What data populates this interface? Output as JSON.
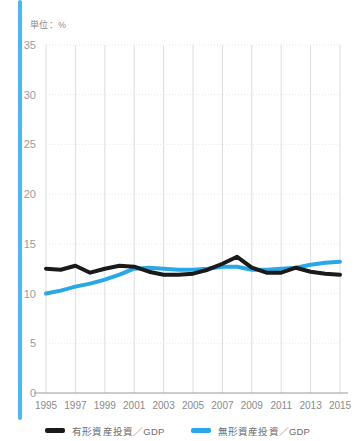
{
  "accent_color": "#4db8f0",
  "unit_label": "単位：%",
  "legend": {
    "items": [
      {
        "label": "有形資産投資／GDP",
        "color": "#1a1a1a"
      },
      {
        "label": "無形資産投資／GDP",
        "color": "#29a8e8"
      }
    ]
  },
  "chart_data": {
    "type": "line",
    "title": "",
    "subtitle": "",
    "xlabel": "",
    "ylabel": "単位：%",
    "ylim": [
      0,
      35
    ],
    "xlim": [
      1995,
      2015
    ],
    "grid": true,
    "legend_position": "bottom",
    "yticks": [
      0,
      5,
      10,
      15,
      20,
      25,
      30,
      35
    ],
    "ytick_labels": [
      "0",
      "5",
      "10",
      "15",
      "20",
      "25",
      "30",
      "35"
    ],
    "xticks": [
      1995,
      1997,
      1999,
      2001,
      2003,
      2005,
      2007,
      2009,
      2011,
      2013,
      2015
    ],
    "xtick_labels": [
      "1995",
      "1997",
      "1999",
      "2001",
      "2003",
      "2005",
      "2007",
      "2009",
      "2011",
      "2013",
      "2015"
    ],
    "x": [
      1995,
      1996,
      1997,
      1998,
      1999,
      2000,
      2001,
      2002,
      2003,
      2004,
      2005,
      2006,
      2007,
      2008,
      2009,
      2010,
      2011,
      2012,
      2013,
      2014,
      2015
    ],
    "series": [
      {
        "name": "有形資産投資／GDP",
        "color": "#1a1a1a",
        "values": [
          12.5,
          12.4,
          12.8,
          12.1,
          12.5,
          12.8,
          12.7,
          12.2,
          11.9,
          11.9,
          12.0,
          12.4,
          13.0,
          13.7,
          12.6,
          12.1,
          12.1,
          12.6,
          12.2,
          12.0,
          11.9
        ]
      },
      {
        "name": "無形資産投資／GDP",
        "color": "#29a8e8",
        "values": [
          10.0,
          10.3,
          10.7,
          11.0,
          11.4,
          11.9,
          12.5,
          12.6,
          12.5,
          12.4,
          12.4,
          12.5,
          12.7,
          12.7,
          12.4,
          12.4,
          12.5,
          12.6,
          12.9,
          13.1,
          13.2
        ]
      }
    ]
  }
}
